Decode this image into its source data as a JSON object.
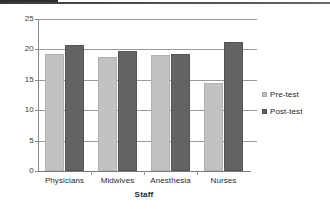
{
  "chart_data": {
    "type": "bar",
    "title": "",
    "xlabel": "Staff",
    "ylabel": "",
    "categories": [
      "Physicians",
      "Midwives",
      "Anesthesia",
      "Nurses"
    ],
    "series": [
      {
        "name": "Pre-test",
        "values": [
          19.2,
          18.8,
          19.0,
          14.4
        ],
        "color": "#c2c2c2"
      },
      {
        "name": "Post-test",
        "values": [
          20.8,
          19.8,
          19.2,
          21.3
        ],
        "color": "#636363"
      }
    ],
    "ylim": [
      0,
      25
    ],
    "yticks": [
      0,
      5,
      10,
      15,
      20,
      25
    ],
    "ytick_labels": [
      "0",
      "5",
      "10",
      "15",
      "20",
      "25"
    ],
    "grid": true,
    "legend_position": "right"
  },
  "legend": {
    "items": [
      {
        "label": "Pre-test"
      },
      {
        "label": "Post-test"
      }
    ]
  },
  "axis": {
    "x_title": "Staff"
  }
}
